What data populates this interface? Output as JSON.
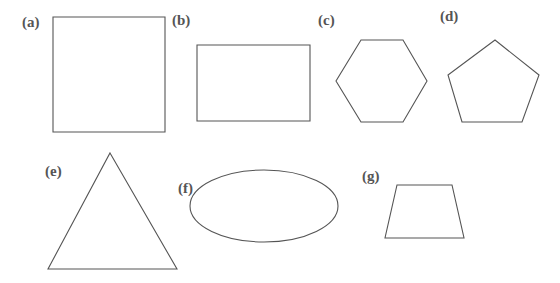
{
  "figure": {
    "canvas": {
      "width": 560,
      "height": 283,
      "background": "#ffffff"
    },
    "stroke_color": "#555555",
    "label_color": "#555555",
    "fill": "none",
    "caption_style": "parenthesized-lowercase-letters",
    "item_count": 7
  },
  "items": [
    {
      "key": "a",
      "label": "(a)",
      "shape": "square",
      "label_pos": {
        "x": 22,
        "y": 15
      },
      "geometry": {
        "type": "rect",
        "x": 53,
        "y": 17,
        "width": 112,
        "height": 115
      }
    },
    {
      "key": "b",
      "label": "(b)",
      "shape": "rectangle",
      "label_pos": {
        "x": 172,
        "y": 13
      },
      "geometry": {
        "type": "rect",
        "x": 197,
        "y": 45,
        "width": 113,
        "height": 76
      }
    },
    {
      "key": "c",
      "label": "(c)",
      "shape": "hexagon",
      "label_pos": {
        "x": 318,
        "y": 13
      },
      "geometry": {
        "type": "polygon",
        "points": "361,40 403,40 427,81 403,122 361,122 336,81"
      }
    },
    {
      "key": "d",
      "label": "(d)",
      "shape": "pentagon",
      "label_pos": {
        "x": 440,
        "y": 9
      },
      "geometry": {
        "type": "polygon",
        "points": "495,40 539,75 522,122 462,122 448,75"
      }
    },
    {
      "key": "e",
      "label": "(e)",
      "shape": "triangle",
      "label_pos": {
        "x": 45,
        "y": 164
      },
      "geometry": {
        "type": "polygon",
        "points": "110,153 177,269 48,269"
      }
    },
    {
      "key": "f",
      "label": "(f)",
      "shape": "ellipse",
      "label_pos": {
        "x": 178,
        "y": 181
      },
      "geometry": {
        "type": "ellipse",
        "cx": 264,
        "cy": 206,
        "rx": 74,
        "ry": 36
      }
    },
    {
      "key": "g",
      "label": "(g)",
      "shape": "trapezoid",
      "label_pos": {
        "x": 362,
        "y": 169
      },
      "geometry": {
        "type": "polygon",
        "points": "397,185 452,185 464,238 385,238"
      }
    }
  ]
}
